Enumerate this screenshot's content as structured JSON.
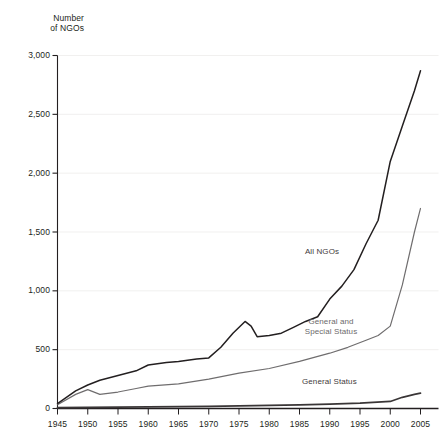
{
  "chart_data": {
    "type": "line",
    "title": "",
    "ylabel": "Number\nof NGOs",
    "xlabel": "",
    "ylim": [
      0,
      3000
    ],
    "xlim": [
      1945,
      2005
    ],
    "yticks": [
      0,
      500,
      1000,
      1500,
      2000,
      2500,
      3000
    ],
    "ytick_labels": [
      "0",
      "500",
      "1,000",
      "1,500",
      "2,000",
      "2,500",
      "3,000"
    ],
    "xticks": [
      1945,
      1950,
      1955,
      1960,
      1965,
      1970,
      1975,
      1980,
      1985,
      1990,
      1995,
      2000,
      2005
    ],
    "xtick_labels": [
      "1945",
      "1950",
      "1955",
      "1960",
      "1965",
      "1970",
      "1975",
      "1980",
      "1985",
      "1990",
      "1995",
      "2000",
      "2005"
    ],
    "grid": true,
    "legend_position": "inline-annotations",
    "series": [
      {
        "name": "All NGOs",
        "color": "#231f20",
        "x": [
          1945,
          1948,
          1950,
          1952,
          1955,
          1958,
          1960,
          1963,
          1965,
          1968,
          1970,
          1972,
          1974,
          1976,
          1977,
          1978,
          1980,
          1982,
          1984,
          1986,
          1988,
          1990,
          1992,
          1994,
          1996,
          1998,
          2000,
          2002,
          2004,
          2005
        ],
        "values": [
          41,
          150,
          200,
          240,
          280,
          320,
          370,
          390,
          400,
          420,
          430,
          520,
          640,
          740,
          700,
          610,
          620,
          640,
          690,
          740,
          780,
          930,
          1040,
          1180,
          1400,
          1600,
          2100,
          2400,
          2700,
          2870
        ]
      },
      {
        "name": "General and Special Status",
        "color": "#6f6d6e",
        "x": [
          1945,
          1948,
          1950,
          1952,
          1955,
          1958,
          1960,
          1965,
          1970,
          1975,
          1980,
          1985,
          1990,
          1993,
          1996,
          1998,
          2000,
          2002,
          2004,
          2005
        ],
        "values": [
          32,
          120,
          160,
          120,
          140,
          170,
          190,
          210,
          250,
          300,
          340,
          400,
          470,
          520,
          580,
          620,
          700,
          1050,
          1500,
          1700
        ]
      },
      {
        "name": "General Status",
        "color": "#3a3637",
        "x": [
          1945,
          1950,
          1955,
          1960,
          1965,
          1970,
          1975,
          1980,
          1985,
          1990,
          1995,
          2000,
          2002,
          2004,
          2005
        ],
        "values": [
          8,
          10,
          12,
          14,
          16,
          18,
          22,
          26,
          30,
          38,
          46,
          60,
          95,
          120,
          130
        ]
      }
    ],
    "annotations": [
      {
        "name": "All NGOs",
        "text": "All NGOs"
      },
      {
        "name": "General and Special Status",
        "text": "General and\nSpecial Status"
      },
      {
        "name": "General Status",
        "text": "General Status"
      }
    ]
  },
  "axes": {
    "y_title": "Number\nof NGOs"
  },
  "colors": {
    "background": "#ffffff",
    "axis": "#231f20",
    "grid": "#e8e6e4",
    "all_ngos": "#231f20",
    "general_special": "#6f6d6e",
    "general": "#3a3637"
  }
}
